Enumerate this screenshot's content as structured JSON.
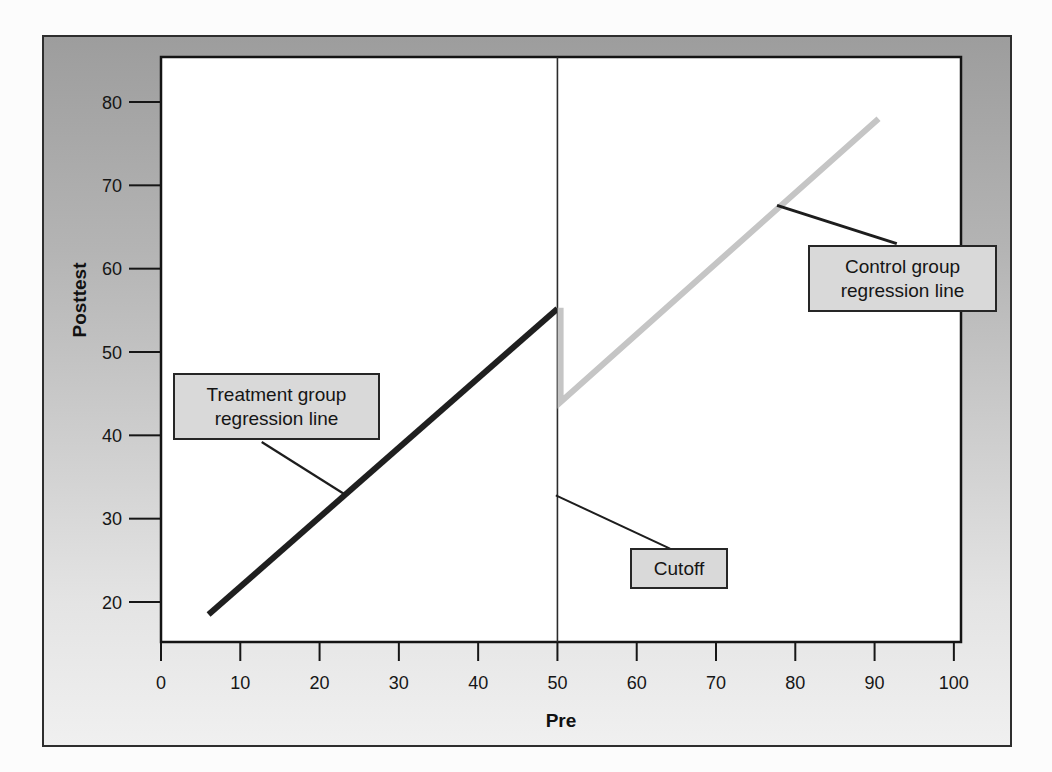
{
  "figure_type": "regression-discontinuity-design-figure",
  "colors": {
    "panel_gradient_top": "#9d9d9d",
    "panel_gradient_bottom": "#f0f0f0",
    "plot_background": "#ffffff",
    "plot_border": "#141414",
    "annotation_box_fill": "#d9d9d9",
    "annotation_box_border": "#262626",
    "treatment_line": "#1f1f1f",
    "control_line": "#c5c5c5",
    "cutoff_line": "#2b2b2b"
  },
  "chart_data": {
    "type": "line",
    "title": "",
    "xlabel": "Pre",
    "ylabel": "Posttest",
    "xlim": [
      0,
      100.9
    ],
    "ylim": [
      15.2,
      85.4
    ],
    "x_ticks": [
      0,
      10,
      20,
      30,
      40,
      50,
      60,
      70,
      80,
      90,
      100
    ],
    "y_ticks": [
      20,
      30,
      40,
      50,
      60,
      70,
      80
    ],
    "grid": false,
    "legend": "none",
    "cutoff_x": 50,
    "discontinuity": {
      "at_x": 50,
      "treatment_line_end_y": 55,
      "control_line_start_y": 44,
      "jump_size": 11
    },
    "series": [
      {
        "name": "Cutoff",
        "role": "cutoff-line",
        "color": "#2b2b2b",
        "stroke_width": 1.6,
        "points": [
          [
            50,
            15.2
          ],
          [
            50,
            85.4
          ]
        ]
      },
      {
        "name": "Treatment group regression line",
        "role": "treatment-regression-line",
        "color": "#1f1f1f",
        "stroke_width": 6,
        "points": [
          [
            6,
            18.5
          ],
          [
            50,
            55.2
          ]
        ]
      },
      {
        "name": "Control group regression line",
        "role": "control-regression-line",
        "color": "#c5c5c5",
        "stroke_width": 6,
        "points": [
          [
            50.4,
            55.3
          ],
          [
            50.4,
            44
          ],
          [
            90.5,
            78
          ]
        ]
      }
    ],
    "annotations": [
      {
        "label": "Treatment group regression line",
        "connector": [
          [
            12.7,
            39.2
          ],
          [
            23.2,
            32.9
          ]
        ],
        "connector_width": 2.2
      },
      {
        "label": "Control group regression line",
        "connector": [
          [
            92.8,
            63.0
          ],
          [
            77.7,
            67.6
          ]
        ],
        "connector_width": 3
      },
      {
        "label": "Cutoff",
        "connector": [
          [
            49.8,
            32.8
          ],
          [
            64.2,
            26.4
          ]
        ],
        "connector_width": 2
      }
    ]
  }
}
